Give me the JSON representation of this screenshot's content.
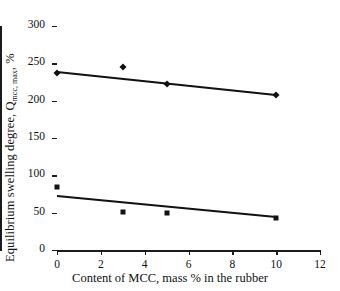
{
  "chart_data": {
    "type": "scatter",
    "title": "",
    "xlabel": "Content of MCC, mass % in the rubber",
    "ylabel_main": "Equilibrium swelling degree, Q",
    "ylabel_sub": "mcc, max",
    "ylabel_tail": ", %",
    "xlim": [
      0,
      12
    ],
    "ylim": [
      0,
      300
    ],
    "xticks": [
      0,
      2,
      4,
      6,
      8,
      10,
      12
    ],
    "yticks": [
      0,
      50,
      100,
      150,
      200,
      250,
      300
    ],
    "grid": false,
    "legend_position": "right-inline",
    "series": [
      {
        "name": "1",
        "marker": "diamond",
        "x": [
          0,
          3,
          5,
          10
        ],
        "values": [
          237,
          245,
          222,
          208
        ],
        "trendline": {
          "x0": 0,
          "y0": 240,
          "x1": 10,
          "y1": 209
        },
        "label": "1"
      },
      {
        "name": "2",
        "marker": "square",
        "x": [
          0,
          3,
          5,
          10
        ],
        "values": [
          84,
          51,
          49,
          43
        ],
        "trendline": {
          "x0": 0,
          "y0": 73,
          "x1": 10,
          "y1": 45
        },
        "label": "2"
      }
    ]
  },
  "colors": {
    "axis": "#1b1b1b",
    "marker": "#111111",
    "trendline": "#111111",
    "background": "#ffffff"
  }
}
